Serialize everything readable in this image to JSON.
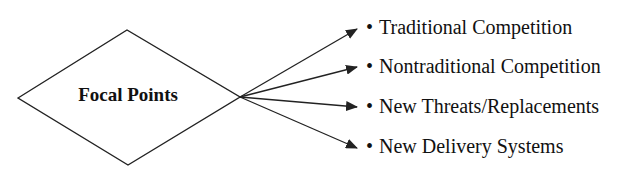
{
  "diagram": {
    "center": {
      "label": "Focal Points"
    },
    "bullet": "•",
    "items": [
      {
        "label": "Traditional Competition"
      },
      {
        "label": "Nontraditional Competition"
      },
      {
        "label": "New Threats/Replacements"
      },
      {
        "label": "New Delivery Systems"
      }
    ],
    "colors": {
      "stroke": "#222222",
      "text": "#111111",
      "background": "#ffffff"
    }
  }
}
